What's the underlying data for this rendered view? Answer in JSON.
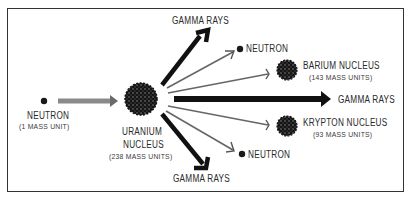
{
  "diagram": {
    "colors": {
      "ink": "#1a1a1a",
      "gray_arrow": "#7a7a7a",
      "border": "#333333",
      "background": "#ffffff"
    },
    "incoming": {
      "particle": {
        "label": "NEUTRON",
        "mass": "(1 MASS UNIT)"
      }
    },
    "target": {
      "label_line1": "URANIUM",
      "label_line2": "NUCLEUS",
      "mass": "(238 MASS UNITS)"
    },
    "products": {
      "gamma_top": "GAMMA RAYS",
      "neutron_top": "NEUTRON",
      "barium": {
        "label": "BARIUM NUCLEUS",
        "mass": "(143 MASS UNITS)"
      },
      "gamma_right": "GAMMA RAYS",
      "krypton": {
        "label": "KRYPTON NUCLEUS",
        "mass": "(93 MASS UNITS)"
      },
      "neutron_bottom": "NEUTRON",
      "gamma_bottom": "GAMMA RAYS"
    }
  }
}
